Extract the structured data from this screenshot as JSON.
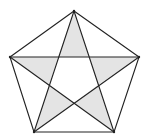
{
  "diagram": {
    "type": "geometry",
    "colors": {
      "background": "#ffffff",
      "stroke": "#222222",
      "shade": "#e4e4e4",
      "inner": "#ffffff"
    },
    "stroke_width": 1.1,
    "vertices": {
      "A": [
        74,
        11
      ],
      "B": [
        139,
        57
      ],
      "C": [
        114,
        132
      ],
      "D": [
        34,
        132
      ],
      "E": [
        10,
        57
      ]
    },
    "inner_points": {
      "P_AE": [
        58,
        57
      ],
      "P_AB": [
        89,
        57
      ],
      "P_BC": [
        98,
        85
      ],
      "P_CD": [
        74,
        103
      ],
      "P_DE": [
        49,
        85
      ]
    },
    "pentagon_edges": [
      [
        "A",
        "B"
      ],
      [
        "B",
        "C"
      ],
      [
        "C",
        "D"
      ],
      [
        "D",
        "E"
      ],
      [
        "E",
        "A"
      ]
    ],
    "star_edges": [
      [
        "A",
        "C"
      ],
      [
        "A",
        "D"
      ],
      [
        "E",
        "B"
      ],
      [
        "E",
        "C"
      ],
      [
        "B",
        "D"
      ]
    ],
    "shaded_triangles": [
      [
        "A",
        "P_AE",
        "P_AB"
      ],
      [
        "B",
        "P_AB",
        "P_BC"
      ],
      [
        "C",
        "P_BC",
        "P_CD"
      ],
      [
        "D",
        "P_CD",
        "P_DE"
      ],
      [
        "E",
        "P_DE",
        "P_AE"
      ]
    ]
  }
}
